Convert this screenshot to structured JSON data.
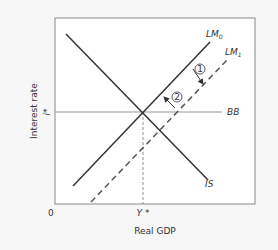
{
  "diagram": {
    "type": "IS-LM-BB macroeconomic diagram",
    "axes": {
      "xlabel": "Real GDP",
      "ylabel": "Interest rate",
      "origin": "0",
      "x_tick": "Y *",
      "y_tick": "i*"
    },
    "curves": {
      "is": "IS",
      "lm0_base": "LM",
      "lm0_sub": "0",
      "lm1_base": "LM",
      "lm1_sub": "1",
      "bb": "BB"
    },
    "steps": {
      "step1": "1",
      "step2": "2"
    },
    "colors": {
      "background": "#f7f7f7",
      "plot_bg": "#ffffff",
      "frame": "#888888",
      "line": "#333333",
      "bb_line": "#999999"
    }
  }
}
